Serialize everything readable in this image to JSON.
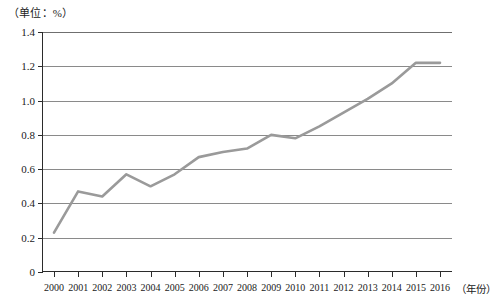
{
  "chart_data": {
    "type": "line",
    "title": "",
    "subtitle": "",
    "unit_caption": "（单位：%）",
    "xlabel": "（年份）",
    "ylabel": "",
    "categories": [
      "2000",
      "2001",
      "2002",
      "2003",
      "2004",
      "2005",
      "2006",
      "2007",
      "2008",
      "2009",
      "2010",
      "2011",
      "2012",
      "2013",
      "2014",
      "2015",
      "2016"
    ],
    "values": [
      0.23,
      0.47,
      0.44,
      0.57,
      0.5,
      0.57,
      0.67,
      0.7,
      0.72,
      0.8,
      0.78,
      0.85,
      0.93,
      1.01,
      1.1,
      1.22,
      1.22
    ],
    "series": [
      {
        "name": "",
        "values": [
          0.23,
          0.47,
          0.44,
          0.57,
          0.5,
          0.57,
          0.67,
          0.7,
          0.72,
          0.8,
          0.78,
          0.85,
          0.93,
          1.01,
          1.1,
          1.22,
          1.22
        ]
      }
    ],
    "ylim": [
      0,
      1.4
    ],
    "yticks": [
      0,
      0.2,
      0.4,
      0.6,
      0.8,
      1.0,
      1.2,
      1.4
    ],
    "ytick_labels": [
      "0",
      "0.2",
      "0.4",
      "0.6",
      "0.8",
      "1.0",
      "1.2",
      "1.4"
    ],
    "grid": true,
    "grid_axis": "y",
    "legend": false,
    "legend_position": "none",
    "line_color": "#9a9a9a",
    "axis_color": "#2b2b2b",
    "grid_color": "#8a8a8a",
    "background_color": "#ffffff"
  }
}
